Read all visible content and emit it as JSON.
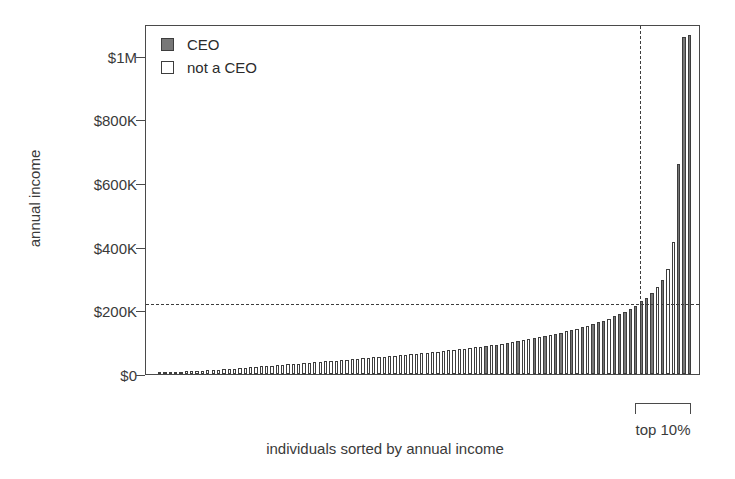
{
  "chart_data": {
    "type": "bar",
    "title": "",
    "subtitle": "",
    "xlabel": "individuals sorted by annual income",
    "ylabel": "annual income",
    "ylim": [
      0,
      1100000
    ],
    "xlim": [
      0,
      100
    ],
    "grid": false,
    "legend_position": "top-left",
    "y_ticks": [
      {
        "value": 0,
        "label": "$0"
      },
      {
        "value": 200000,
        "label": "$200K"
      },
      {
        "value": 400000,
        "label": "$400K"
      },
      {
        "value": 600000,
        "label": "$600K"
      },
      {
        "value": 800000,
        "label": "$800K"
      },
      {
        "value": 1000000,
        "label": "$1M"
      }
    ],
    "x_ticks": [],
    "legend": [
      {
        "name": "CEO",
        "color": "#777777"
      },
      {
        "name": "not a CEO",
        "color": "#ffffff"
      }
    ],
    "series": [
      {
        "name": "annual income",
        "categories_note": "100 individuals sorted ascending by annual income",
        "values": [
          3000,
          4000,
          5000,
          6000,
          7000,
          8000,
          9000,
          10000,
          11000,
          12000,
          13000,
          14000,
          15000,
          16000,
          17000,
          19000,
          20000,
          21000,
          22000,
          24000,
          25000,
          26000,
          28000,
          29000,
          30000,
          32000,
          33000,
          34000,
          36000,
          37000,
          38000,
          40000,
          41000,
          42000,
          44000,
          45000,
          46000,
          48000,
          49000,
          50000,
          52000,
          53000,
          55000,
          56000,
          58000,
          59000,
          61000,
          62000,
          64000,
          65000,
          67000,
          69000,
          70000,
          72000,
          74000,
          76000,
          78000,
          80000,
          82000,
          84000,
          86000,
          88000,
          90000,
          92000,
          95000,
          97000,
          100000,
          103000,
          106000,
          109000,
          112000,
          115000,
          118000,
          122000,
          126000,
          130000,
          134000,
          138000,
          142000,
          147000,
          152000,
          157000,
          162000,
          168000,
          174000,
          181000,
          188000,
          196000,
          205000,
          215000,
          228000,
          240000,
          255000,
          272000,
          295000,
          330000,
          415000,
          660000,
          1060000,
          1065000
        ],
        "is_ceo": [
          false,
          false,
          false,
          false,
          false,
          false,
          false,
          false,
          false,
          false,
          false,
          false,
          false,
          false,
          false,
          false,
          false,
          false,
          false,
          false,
          false,
          false,
          false,
          false,
          false,
          false,
          false,
          false,
          false,
          false,
          false,
          false,
          false,
          false,
          false,
          false,
          false,
          false,
          false,
          false,
          false,
          false,
          false,
          false,
          false,
          false,
          false,
          false,
          false,
          false,
          false,
          false,
          false,
          false,
          false,
          false,
          false,
          false,
          false,
          false,
          false,
          true,
          false,
          true,
          false,
          true,
          false,
          true,
          false,
          false,
          true,
          false,
          true,
          false,
          true,
          true,
          false,
          true,
          false,
          true,
          false,
          true,
          true,
          true,
          false,
          true,
          true,
          true,
          true,
          true,
          true,
          true,
          true,
          false,
          true,
          false,
          false,
          true,
          true,
          true
        ]
      }
    ],
    "annotations": [
      {
        "name": "percentile-90-line",
        "type": "vline",
        "x_fraction": 0.9,
        "style": "dashed"
      },
      {
        "name": "income-threshold-line",
        "type": "hline",
        "value": 225000,
        "style": "dashed"
      },
      {
        "name": "top-10-percent-bracket",
        "type": "bracket",
        "label": "top 10%"
      }
    ]
  },
  "axes": {
    "y_title": "annual income",
    "x_title": "individuals sorted by annual income"
  },
  "legend": {
    "items": [
      {
        "label": "CEO",
        "swatch": "ceo"
      },
      {
        "label": "not a CEO",
        "swatch": "noceo"
      }
    ]
  },
  "bracket": {
    "label": "top 10%"
  },
  "colors": {
    "ceo_fill": "#777777",
    "noceo_fill": "#ffffff",
    "stroke": "#3d3d3d",
    "axis": "#4a4a4a",
    "text": "#3a3a3a"
  }
}
